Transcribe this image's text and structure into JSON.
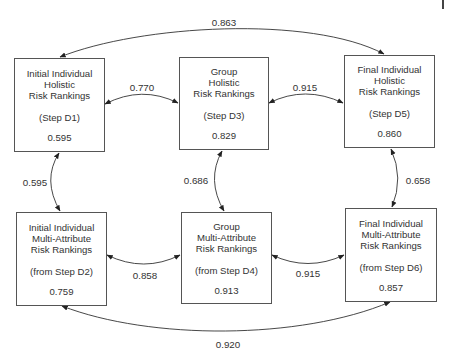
{
  "diagram": {
    "title": "",
    "nodes": [
      {
        "id": "D1",
        "title": "Initial Individual\nHolistic\nRisk Rankings",
        "step": "(Step D1)",
        "value": "0.595"
      },
      {
        "id": "D3",
        "title": "Group\nHolistic\nRisk Rankings",
        "step": "(Step D3)",
        "value": "0.829"
      },
      {
        "id": "D5",
        "title": "Final Individual\nHolistic\nRisk Rankings",
        "step": "(Step D5)",
        "value": "0.860"
      },
      {
        "id": "D2",
        "title": "Initial Individual\nMulti-Attribute\nRisk Rankings",
        "step": "(from Step D2)",
        "value": "0.759"
      },
      {
        "id": "D4",
        "title": "Group\nMulti-Attribute\nRisk Rankings",
        "step": "(from Step D4)",
        "value": "0.913"
      },
      {
        "id": "D6",
        "title": "Final Individual\nMulti-Attribute\nRisk Rankings",
        "step": "(from Step D6)",
        "value": "0.857"
      }
    ],
    "edges": [
      {
        "from": "D1",
        "to": "D5",
        "label": "0.863"
      },
      {
        "from": "D1",
        "to": "D3",
        "label": "0.770"
      },
      {
        "from": "D3",
        "to": "D5",
        "label": "0.915"
      },
      {
        "from": "D1",
        "to": "D2",
        "label": "0.595"
      },
      {
        "from": "D3",
        "to": "D4",
        "label": "0.686"
      },
      {
        "from": "D5",
        "to": "D6",
        "label": "0.658"
      },
      {
        "from": "D2",
        "to": "D4",
        "label": "0.858"
      },
      {
        "from": "D4",
        "to": "D6",
        "label": "0.915"
      },
      {
        "from": "D2",
        "to": "D6",
        "label": "0.920"
      }
    ],
    "colors": {
      "line": "#333333",
      "box_border": "#555555",
      "text": "#333333",
      "background": "#ffffff"
    }
  }
}
